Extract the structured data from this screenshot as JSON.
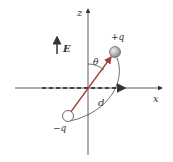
{
  "diagram": {
    "labels": {
      "z_axis": "z",
      "x_axis": "x",
      "field": "E",
      "angle": "θ",
      "distance": "d",
      "positive_charge": "+q",
      "negative_charge": "−q"
    },
    "colors": {
      "axis": "#333333",
      "dipole": "#a0413a",
      "positive_charge_fill": "#b8b8b8",
      "negative_charge_fill": "#ffffff",
      "text": "#333333"
    }
  }
}
